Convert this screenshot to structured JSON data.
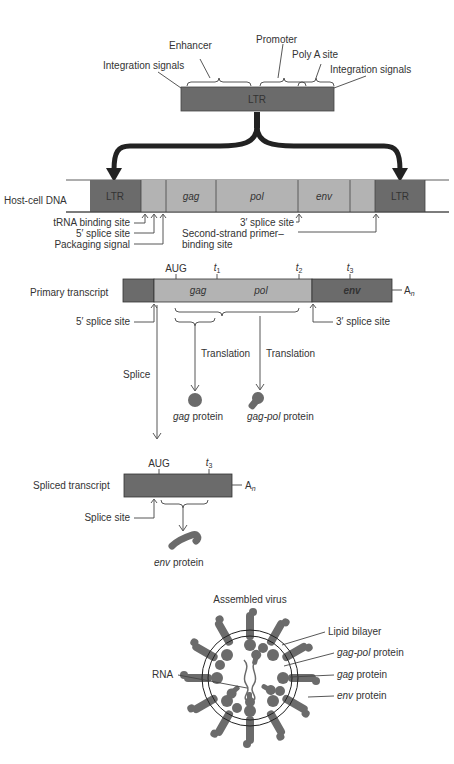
{
  "ltr_detail": {
    "box_label": "LTR",
    "labels": {
      "enhancer": "Enhancer",
      "promoter": "Promoter",
      "poly_a_site": "Poly A site",
      "integration_left": "Integration signals",
      "integration_right": "Integration signals"
    }
  },
  "host_dna": {
    "row_label": "Host-cell DNA",
    "segments": [
      "LTR",
      "",
      "gag",
      "pol",
      "env",
      "",
      "LTR"
    ],
    "annotations": {
      "trna": "tRNA binding site",
      "splice5": "5′ splice site",
      "packaging": "Packaging signal",
      "splice3": "3′ splice site",
      "second_strand_1": "Second-strand primer–",
      "second_strand_2": "binding site"
    }
  },
  "primary_transcript": {
    "row_label": "Primary transcript",
    "markers": {
      "aug": "AUG",
      "t1": "t",
      "t1_sub": "1",
      "t2": "t",
      "t2_sub": "2",
      "t3": "t",
      "t3_sub": "3"
    },
    "segments": {
      "gag": "gag",
      "pol": "pol",
      "env": "env"
    },
    "tail": "A",
    "tail_sub": "n",
    "splice5": "5′ splice site",
    "splice3": "3′ splice site",
    "translation_left": "Translation",
    "translation_right": "Translation",
    "splice": "Splice",
    "gag_protein_italic": "gag",
    "gag_protein_rest": " protein",
    "gagpol_protein_italic": "gag-pol",
    "gagpol_protein_rest": " protein"
  },
  "spliced_transcript": {
    "row_label": "Spliced transcript",
    "aug": "AUG",
    "t3": "t",
    "t3_sub": "3",
    "tail": "A",
    "tail_sub": "n",
    "splice_site": "Splice site",
    "env_protein_italic": "env",
    "env_protein_rest": " protein"
  },
  "virus": {
    "title": "Assembled virus",
    "labels": {
      "lipid": "Lipid bilayer",
      "gagpol_italic": "gag-pol",
      "gagpol_rest": " protein",
      "gag_italic": "gag",
      "gag_rest": " protein",
      "env_italic": "env",
      "env_rest": " protein",
      "rna": "RNA"
    }
  },
  "colors": {
    "dark": "#6b6b6b",
    "light": "#b3b3b3",
    "text": "#333333"
  }
}
